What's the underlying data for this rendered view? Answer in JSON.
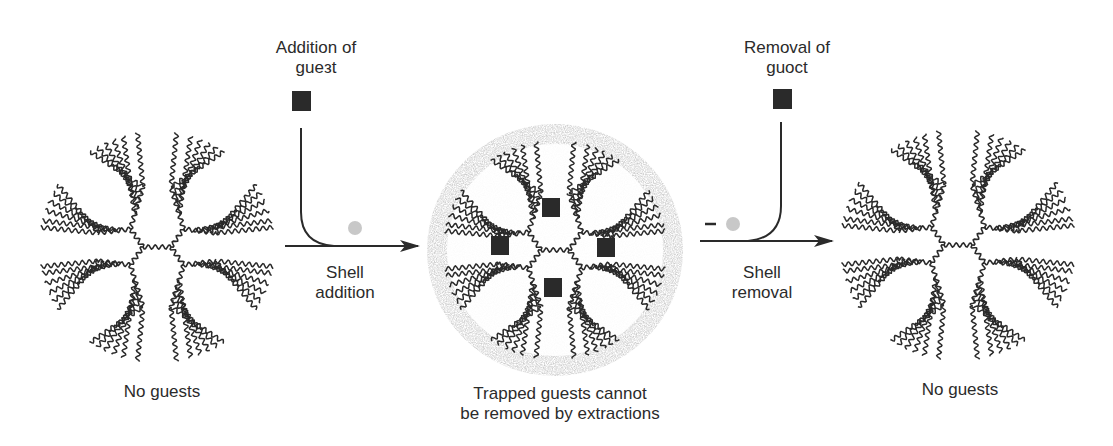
{
  "colors": {
    "ink": "#2a2a2a",
    "shell": "#b8b8b8",
    "removed_dot": "#c8c8c8",
    "background": "#ffffff"
  },
  "steps": [
    {
      "id": "initial",
      "caption": [
        "No guests"
      ],
      "dendrimer": {
        "cx": 157,
        "cy": 247,
        "rx": 118,
        "ry": 116,
        "shell": false,
        "guests": 0
      }
    },
    {
      "id": "trapped",
      "caption": [
        "Trapped guests cannot",
        "be removed by extractions"
      ],
      "dendrimer": {
        "cx": 555,
        "cy": 250,
        "rx": 112,
        "ry": 110,
        "shell": true,
        "guests": 4
      }
    },
    {
      "id": "final",
      "caption": [
        "No guests"
      ],
      "dendrimer": {
        "cx": 958,
        "cy": 245,
        "rx": 118,
        "ry": 116,
        "shell": false,
        "guests": 0
      }
    }
  ],
  "transitions": [
    {
      "id": "shell-addition",
      "top_label": [
        "Addition of",
        "guest"
      ],
      "top_label_as_rendered": [
        "Addition of",
        "gueзt"
      ],
      "arrow_label": [
        "Shell",
        "addition"
      ],
      "guest_icon": "filled-square",
      "shell_icon": "gray-dot",
      "shell_sign": ""
    },
    {
      "id": "shell-removal",
      "top_label": [
        "Removal of",
        "guoct"
      ],
      "arrow_label": [
        "Shell",
        "removal"
      ],
      "guest_icon": "filled-square",
      "shell_icon": "gray-dot",
      "shell_sign": "–"
    }
  ]
}
